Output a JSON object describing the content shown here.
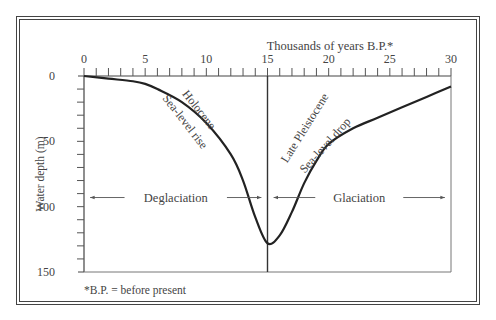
{
  "chart_data": {
    "type": "line",
    "title": "",
    "xlabel": "Thousands of years B.P.*",
    "ylabel": "Water depth (m)",
    "x_ticks": [
      "0",
      "5",
      "10",
      "15",
      "20",
      "25",
      "30"
    ],
    "y_ticks": [
      "0",
      "50",
      "100",
      "150"
    ],
    "xlim": [
      0,
      30
    ],
    "ylim": [
      0,
      150
    ],
    "y_inverted": true,
    "grid": false,
    "series": [
      {
        "name": "Sea level",
        "x": [
          0,
          2,
          4,
          5,
          6,
          8,
          10,
          12,
          13,
          14,
          15,
          16,
          17,
          18,
          19,
          20,
          22,
          24,
          26,
          28,
          30
        ],
        "y": [
          0,
          2,
          4,
          6,
          10,
          20,
          36,
          60,
          80,
          108,
          128,
          122,
          104,
          82,
          65,
          52,
          40,
          32,
          24,
          16,
          8
        ]
      }
    ],
    "vertical_line_x": 15,
    "annotations": [
      {
        "text": "Holocene",
        "x": 10.5,
        "y": 28
      },
      {
        "text": "Sea-level rise",
        "x": 9.5,
        "y": 36
      },
      {
        "text": "Late Pleistocene",
        "x": 21,
        "y": 40
      },
      {
        "text": "Sea-level drop",
        "x": 23,
        "y": 45
      },
      {
        "text": "Deglaciation",
        "x": 7.5,
        "y": 93,
        "arrow_span": [
          0.5,
          14.5
        ]
      },
      {
        "text": "Glaciation",
        "x": 22.5,
        "y": 93,
        "arrow_span": [
          15.5,
          29.5
        ]
      }
    ],
    "footnote": "*B.P. = before present"
  }
}
